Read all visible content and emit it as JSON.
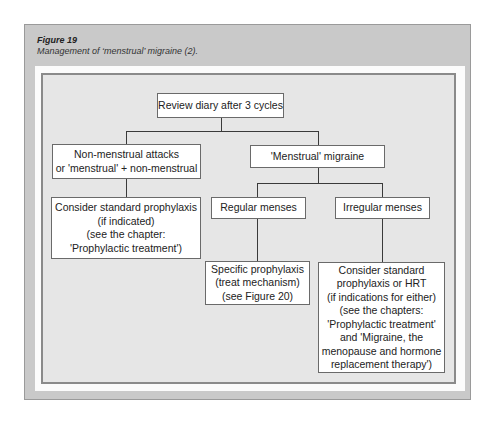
{
  "figure": {
    "label": "Figure 19",
    "caption": "Management of ‘menstrual’ migraine (2)."
  },
  "nodes": {
    "review": "Review diary after 3 cycles",
    "non_menstrual": "Non-menstrual attacks\nor 'menstrual' + non-menstrual",
    "menstrual": "'Menstrual' migraine",
    "consider_standard": "Consider standard prophylaxis\n(if indicated)\n(see the chapter:\n'Prophylactic treatment')",
    "regular": "Regular menses",
    "irregular": "Irregular menses",
    "specific": "Specific prophylaxis\n(treat mechanism)\n(see Figure 20)",
    "consider_hrt": "Consider standard\nprophylaxis or HRT\n(if indications for either)\n(see the chapters:\n'Prophylactic treatment'\nand 'Migraine, the\nmenopause  and hormone\nreplacement therapy')"
  },
  "edges": [
    {
      "from": "review",
      "to": "non_menstrual"
    },
    {
      "from": "review",
      "to": "menstrual"
    },
    {
      "from": "non_menstrual",
      "to": "consider_standard"
    },
    {
      "from": "menstrual",
      "to": "regular"
    },
    {
      "from": "menstrual",
      "to": "irregular"
    },
    {
      "from": "regular",
      "to": "specific"
    },
    {
      "from": "irregular",
      "to": "consider_hrt"
    }
  ]
}
